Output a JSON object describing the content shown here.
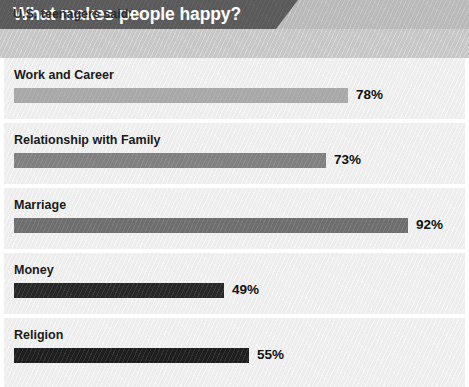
{
  "header": {
    "title": "What makes people happy?",
    "subtitle": "U.S. teenagers said:"
  },
  "chart_data": {
    "type": "bar",
    "orientation": "horizontal",
    "title": "What makes people happy?",
    "subtitle": "U.S. teenagers said:",
    "xlabel": "",
    "ylabel": "",
    "xlim": [
      0,
      100
    ],
    "grid": false,
    "legend": null,
    "value_suffix": "%",
    "categories": [
      "Work and Career",
      "Relationship with Family",
      "Marriage",
      "Money",
      "Religion"
    ],
    "values": [
      78,
      73,
      92,
      49,
      55
    ],
    "value_labels": [
      "78%",
      "73%",
      "92%",
      "49%",
      "55%"
    ],
    "bar_colors": [
      "#a8a8a8",
      "#808080",
      "#6e6e6e",
      "#272727",
      "#1e1e1e"
    ],
    "bars": [
      {
        "category": "Work and Career",
        "value": 78,
        "label": "78%",
        "color": "#a8a8a8"
      },
      {
        "category": "Relationship with Family",
        "value": 73,
        "label": "73%",
        "color": "#808080"
      },
      {
        "category": "Marriage",
        "value": 92,
        "label": "92%",
        "color": "#6e6e6e"
      },
      {
        "category": "Money",
        "value": 49,
        "label": "49%",
        "color": "#272727"
      },
      {
        "category": "Religion",
        "value": 55,
        "label": "55%",
        "color": "#1e1e1e"
      }
    ]
  },
  "style": {
    "header_band": "#b9b9b9",
    "header_tab": "#5a5a5a",
    "subtitle_band": "#c6c6c6",
    "row_background": "#ededed",
    "title_color": "#ffffff",
    "label_color": "#1a1a1a"
  }
}
